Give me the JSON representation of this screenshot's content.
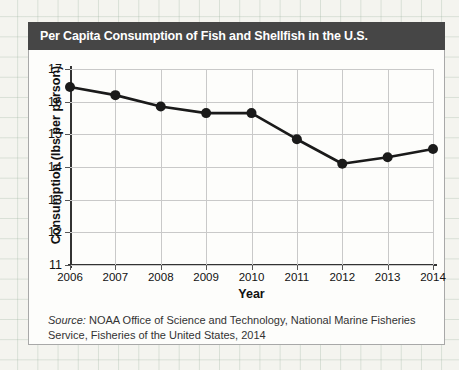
{
  "figure": {
    "title": "Per Capita Consumption of Fish and Shellfish in the U.S.",
    "title_bar_color": "#464646",
    "title_text_color": "#ffffff",
    "border_color": "#a8a8a8",
    "background_color": "#fdfdfb"
  },
  "source": {
    "label": "Source:",
    "text": " NOAA Office of Science and Technology, National Marine Fisheries Service, Fisheries of the United States, 2014"
  },
  "chart_data": {
    "type": "line",
    "title": "Per Capita Consumption of Fish and Shellfish in the U.S.",
    "xlabel": "Year",
    "ylabel": "Consumption (lbs per person)",
    "categories": [
      "2006",
      "2007",
      "2008",
      "2009",
      "2010",
      "2011",
      "2012",
      "2013",
      "2014"
    ],
    "x": [
      2006,
      2007,
      2008,
      2009,
      2010,
      2011,
      2012,
      2013,
      2014
    ],
    "values": [
      16.45,
      16.2,
      15.85,
      15.65,
      15.65,
      14.85,
      14.1,
      14.3,
      14.55
    ],
    "ylim": [
      11,
      17
    ],
    "xlim": [
      2006,
      2014
    ],
    "yticks": [
      11,
      12,
      13,
      14,
      15,
      16,
      17
    ],
    "ytick_labels": [
      "11",
      "12",
      "13",
      "14",
      "15",
      "16",
      "17"
    ],
    "xticks": [
      2006,
      2007,
      2008,
      2009,
      2010,
      2011,
      2012,
      2013,
      2014
    ],
    "xtick_labels": [
      "2006",
      "2007",
      "2008",
      "2009",
      "2010",
      "2011",
      "2012",
      "2013",
      "2014"
    ],
    "grid": true,
    "grid_color": "#c9c9c9",
    "legend": false,
    "legend_position": "none",
    "series_color": "#1a1a1a",
    "marker": "circle",
    "marker_size": 5,
    "line_width": 2.6
  }
}
